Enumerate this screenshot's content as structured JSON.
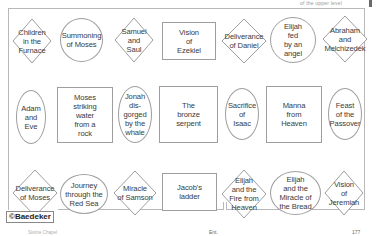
{
  "header": {
    "running_text": "of the upper level"
  },
  "diagram": {
    "credit": "©Baedeker",
    "rows": [
      {
        "shapes": [
          {
            "type": "diamond",
            "label": "Children\nin the\nFurnace"
          },
          {
            "type": "ellipse",
            "label": "Summoning\nof Moses"
          },
          {
            "type": "diamond",
            "label": "Samuel\nand\nSaul"
          },
          {
            "type": "rect",
            "label": "Vision\nof\nEzekiel"
          },
          {
            "type": "diamond",
            "label": "Deliverance\nof Daniel"
          },
          {
            "type": "ellipse",
            "label": "Elijah\nfed\nby an\nangel"
          },
          {
            "type": "diamond",
            "label": "Abraham\nand\nMelchizedek"
          }
        ]
      },
      {
        "shapes": [
          {
            "type": "ellipse",
            "label": "Adam\nand\nEve"
          },
          {
            "type": "rect",
            "label": "Moses\nstriking\nwater\nfrom a\nrock"
          },
          {
            "type": "ellipse",
            "label": "Jonah\ndis-\ngorged\nby the\nwhale"
          },
          {
            "type": "rect",
            "label": "The\nbronze\nserpent"
          },
          {
            "type": "ellipse",
            "label": "Sacrifice\nof\nIsaac"
          },
          {
            "type": "rect",
            "label": "Manna\nfrom\nHeaven"
          },
          {
            "type": "ellipse",
            "label": "Feast\nof the\nPassover"
          }
        ]
      },
      {
        "shapes": [
          {
            "type": "diamond",
            "label": "Deliverance\nof Moses"
          },
          {
            "type": "ellipse",
            "label": "Journey\nthrough the\nRed Sea"
          },
          {
            "type": "diamond",
            "label": "Miracle\nof Samson"
          },
          {
            "type": "rect",
            "label": "Jacob's\nladder"
          },
          {
            "type": "diamond",
            "label": "Elijah\nand the\nFire from\nHeaven"
          },
          {
            "type": "ellipse",
            "label": "Elijah\nand the\nMiracle of\nthe Bread"
          },
          {
            "type": "diamond",
            "label": "Vision\nof\nJeremiah"
          }
        ]
      }
    ]
  },
  "footer": {
    "left": "Sistine Chapel",
    "mid": "Ent.",
    "right": "177"
  }
}
